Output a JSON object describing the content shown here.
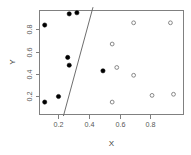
{
  "chart_data": {
    "type": "scatter",
    "title": "",
    "xlabel": "X",
    "ylabel": "Y",
    "xlim": [
      0.04,
      1.0
    ],
    "ylim": [
      0.03,
      1.0
    ],
    "grid": false,
    "legend": "none",
    "xticks": [
      0.2,
      0.4,
      0.6,
      0.8
    ],
    "xtick_labels": [
      "0.2",
      "0.4",
      "0.6",
      "0.8"
    ],
    "yticks": [
      0.2,
      0.4,
      0.6,
      0.8
    ],
    "ytick_labels": [
      "0.2",
      "0.4",
      "0.6",
      "0.8"
    ],
    "series": [
      {
        "name": "class-1-filled",
        "marker": "filled-circle",
        "color": "#000000",
        "points": [
          {
            "x": 0.11,
            "y": 0.84
          },
          {
            "x": 0.27,
            "y": 0.94
          },
          {
            "x": 0.32,
            "y": 0.95
          },
          {
            "x": 0.26,
            "y": 0.55
          },
          {
            "x": 0.27,
            "y": 0.48
          },
          {
            "x": 0.49,
            "y": 0.43
          },
          {
            "x": 0.2,
            "y": 0.2
          },
          {
            "x": 0.11,
            "y": 0.15
          }
        ]
      },
      {
        "name": "class-2-open",
        "marker": "open-circle",
        "color": "#7a7a7a",
        "points": [
          {
            "x": 0.55,
            "y": 0.67
          },
          {
            "x": 0.69,
            "y": 0.86
          },
          {
            "x": 0.93,
            "y": 0.86
          },
          {
            "x": 0.58,
            "y": 0.46
          },
          {
            "x": 0.69,
            "y": 0.39
          },
          {
            "x": 0.81,
            "y": 0.21
          },
          {
            "x": 0.95,
            "y": 0.22
          },
          {
            "x": 0.55,
            "y": 0.15
          }
        ]
      }
    ],
    "annotations": [
      {
        "name": "decision-boundary",
        "type": "line",
        "x1": 0.232,
        "y1": 0.025,
        "x2": 0.425,
        "y2": 1.0,
        "color": "#6e6e6e"
      }
    ]
  },
  "axes": {
    "x_title": "X",
    "y_title": "Y"
  }
}
